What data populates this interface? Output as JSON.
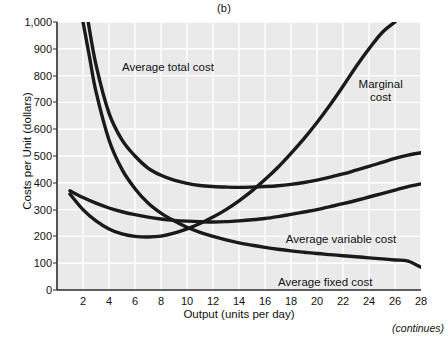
{
  "figure": {
    "panel_label": "(b)",
    "continues_note": "(continues)"
  },
  "chart_data": {
    "type": "line",
    "title": "(b)",
    "xlabel": "Output (units per day)",
    "ylabel": "Costs per Unit (dollars)",
    "xlim": [
      0,
      28
    ],
    "ylim": [
      0,
      1000
    ],
    "xticks": [
      2,
      4,
      6,
      8,
      10,
      12,
      14,
      16,
      18,
      20,
      22,
      24,
      26,
      28
    ],
    "xtick_labels": [
      "2",
      "4",
      "6",
      "8",
      "10",
      "12",
      "14",
      "16",
      "18",
      "20",
      "22",
      "24",
      "26",
      "28"
    ],
    "yticks": [
      0,
      100,
      200,
      300,
      400,
      500,
      600,
      700,
      800,
      900,
      1000
    ],
    "ytick_labels": [
      "0",
      "100",
      "200",
      "300",
      "400",
      "500",
      "600",
      "700",
      "800",
      "900",
      "1,000"
    ],
    "grid": true,
    "grid_color": "#ffffff",
    "plot_background": "#eaeaea",
    "curve_color": "#1a1a1a",
    "legend_position": "inline-annotations",
    "series": [
      {
        "name": "Average total cost",
        "label": "Average total cost",
        "label_position": {
          "x": 5.0,
          "y": 855
        },
        "x": [
          2.4,
          3,
          4,
          5,
          6,
          7,
          8,
          9,
          10,
          11,
          12,
          13,
          14,
          15,
          16,
          17,
          18,
          19,
          20,
          21,
          22,
          23,
          24,
          25,
          26,
          27,
          28
        ],
        "y": [
          1000,
          840,
          660,
          560,
          500,
          455,
          428,
          410,
          398,
          390,
          386,
          384,
          383,
          384,
          386,
          389,
          394,
          401,
          410,
          421,
          433,
          447,
          461,
          476,
          491,
          503,
          512
        ]
      },
      {
        "name": "Average variable cost",
        "label": "Average variable cost",
        "label_position": {
          "x": 17.6,
          "y": 212
        },
        "x": [
          1,
          2,
          3,
          4,
          5,
          6,
          7,
          8,
          9,
          10,
          11,
          12,
          13,
          14,
          15,
          16,
          17,
          18,
          19,
          20,
          21,
          22,
          23,
          24,
          25,
          26,
          27,
          28
        ],
        "y": [
          370,
          345,
          324,
          306,
          292,
          281,
          272,
          265,
          260,
          257,
          255,
          254,
          255,
          258,
          262,
          267,
          274,
          282,
          291,
          300,
          311,
          322,
          334,
          347,
          360,
          373,
          386,
          396
        ]
      },
      {
        "name": "Marginal cost",
        "label": "Marginal\ncost",
        "label_position": {
          "x": 23.2,
          "y": 790
        },
        "x": [
          1,
          2,
          3,
          4,
          5,
          6,
          7,
          8,
          9,
          10,
          11,
          12,
          13,
          14,
          15,
          16,
          17,
          18,
          19,
          20,
          21,
          22,
          23,
          24,
          25,
          26
        ],
        "y": [
          358,
          300,
          258,
          228,
          209,
          200,
          198,
          201,
          212,
          228,
          248,
          272,
          300,
          333,
          370,
          412,
          458,
          510,
          565,
          625,
          690,
          760,
          833,
          900,
          960,
          1000
        ]
      },
      {
        "name": "Average fixed cost",
        "label": "Average fixed cost",
        "label_position": {
          "x": 17.0,
          "y": 52
        },
        "x": [
          2.0,
          2.5,
          3,
          4,
          5,
          6,
          7,
          8,
          9,
          10,
          11,
          12,
          13,
          14,
          15,
          16,
          17,
          18,
          19,
          20,
          21,
          22,
          23,
          24,
          25,
          26,
          27,
          28
        ],
        "y": [
          1000,
          870,
          740,
          560,
          450,
          378,
          325,
          287,
          258,
          234,
          215,
          200,
          187,
          176,
          167,
          159,
          152,
          146,
          141,
          136,
          132,
          128,
          124,
          120,
          116,
          112,
          108,
          85
        ]
      }
    ]
  }
}
